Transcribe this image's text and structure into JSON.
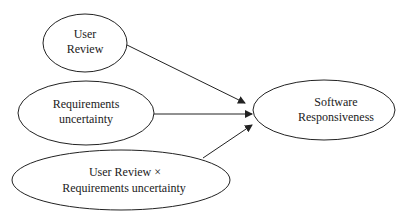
{
  "diagram": {
    "nodes": [
      {
        "id": "user_review",
        "lines": [
          "User",
          "Review"
        ]
      },
      {
        "id": "requirements_uncertainty",
        "lines": [
          "Requirements",
          "uncertainty"
        ]
      },
      {
        "id": "interaction",
        "lines": [
          "User Review  ×",
          "Requirements uncertainty"
        ]
      },
      {
        "id": "software_responsiveness",
        "lines": [
          "Software",
          "Responsiveness"
        ]
      }
    ],
    "edges": [
      {
        "from": "user_review",
        "to": "software_responsiveness"
      },
      {
        "from": "requirements_uncertainty",
        "to": "software_responsiveness"
      },
      {
        "from": "interaction",
        "to": "software_responsiveness"
      }
    ],
    "colors": {
      "stroke": "#222222",
      "background": "#ffffff"
    }
  }
}
